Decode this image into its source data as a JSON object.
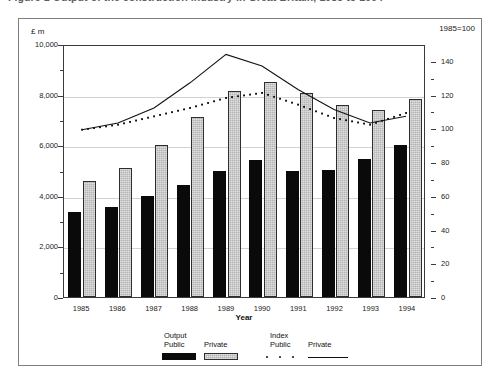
{
  "title": {
    "text": "Figure 1  Output of the construction industry in Great Britain, 1985 to 1994"
  },
  "axes": {
    "left_unit": "£ m",
    "right_unit": "1985=100",
    "x_title": "Year",
    "left_ticks": [
      "10,000",
      "8,000",
      "6,000",
      "4,000",
      "2,000",
      "0"
    ],
    "right_ticks": [
      "140",
      "120",
      "100",
      "80",
      "60",
      "40",
      "20",
      "0"
    ]
  },
  "legend": {
    "group_output": "Output",
    "group_index": "Index",
    "output_public": "Public",
    "output_private": "Private",
    "index_public": "Public",
    "index_private": "Private"
  },
  "colors": {
    "public_bar": "#0a0a0a",
    "private_bar": "#b4b4b4",
    "private_bar_border": "#2e2e2e",
    "line": "#111111",
    "grid": "#d2d2d2",
    "frame": "#7d7d7d",
    "plot_border": "#3b3b3b"
  },
  "chart_data": {
    "type": "bar",
    "title": "Output of the construction industry in Great Britain, 1985 to 1994",
    "xlabel": "Year",
    "ylabel": "£ m",
    "y2label": "1985=100",
    "categories": [
      "1985",
      "1986",
      "1987",
      "1988",
      "1989",
      "1990",
      "1991",
      "1992",
      "1993",
      "1994"
    ],
    "ylim": [
      0,
      10000
    ],
    "y2lim": [
      0,
      150
    ],
    "grid": true,
    "legend_position": "bottom",
    "series": [
      {
        "name": "Output Public",
        "type": "bar",
        "axis": "left",
        "values": [
          3350,
          3570,
          3980,
          4430,
          4980,
          5400,
          4970,
          5030,
          5460,
          6000
        ]
      },
      {
        "name": "Output Private",
        "type": "bar",
        "axis": "left",
        "values": [
          4580,
          5100,
          6020,
          7100,
          8130,
          8500,
          8050,
          7600,
          7400,
          7820
        ]
      },
      {
        "name": "Index Public",
        "type": "line",
        "style": "dotted",
        "axis": "right",
        "values": [
          100,
          103,
          108,
          113,
          119,
          122,
          115,
          107,
          103,
          110
        ]
      },
      {
        "name": "Index Private",
        "type": "line",
        "style": "solid",
        "axis": "right",
        "values": [
          100,
          104,
          113,
          128,
          145,
          138,
          124,
          112,
          104,
          108
        ]
      }
    ]
  }
}
